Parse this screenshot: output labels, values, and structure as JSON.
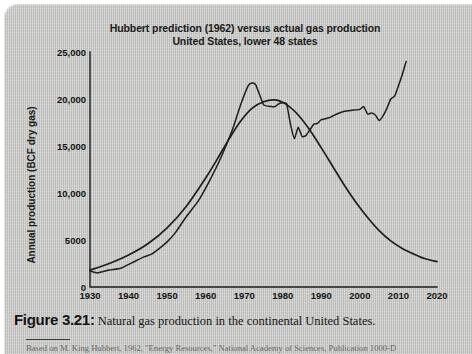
{
  "figure": {
    "number_label": "Figure 3.21:",
    "caption_text": " Natural gas production in the continental United States.",
    "attribution": "Based on M. King Hubbert, 1962, \"Energy Resources,\" National Academy of Sciences, Publication 1000-D"
  },
  "chart_data": {
    "type": "line",
    "title": "Hubbert prediction (1962) versus actual gas production United States, lower 48 states",
    "title_line1": "Hubbert prediction (1962) versus actual gas production",
    "title_line2": "United States, lower 48 states",
    "xlabel": "",
    "ylabel": "Annual production (BCF dry gas)",
    "xlim": [
      1930,
      2020
    ],
    "ylim": [
      0,
      25000
    ],
    "grid": false,
    "legend": "none",
    "xticks": [
      1930,
      1940,
      1950,
      1960,
      1970,
      1980,
      1990,
      2000,
      2010,
      2020
    ],
    "xtick_labels": [
      "1930",
      "1940",
      "1950",
      "1960",
      "1970",
      "1980",
      "1990",
      "2000",
      "2010",
      "2020"
    ],
    "yticks": [
      0,
      5000,
      10000,
      15000,
      20000,
      25000
    ],
    "ytick_labels": [
      "0",
      "5000",
      "10,000",
      "15,000",
      "20,000",
      "25,000"
    ],
    "line_color": "#1e1e1e",
    "series": [
      {
        "name": "Hubbert prediction (1962)",
        "x": [
          1930,
          1935,
          1940,
          1945,
          1950,
          1955,
          1960,
          1963,
          1966,
          1969,
          1972,
          1975,
          1978,
          1981,
          1984,
          1987,
          1990,
          1993,
          1996,
          1999,
          2002,
          2005,
          2008,
          2011,
          2014,
          2017,
          2020
        ],
        "values": [
          1800,
          2500,
          3400,
          4600,
          6300,
          8600,
          11600,
          13600,
          15700,
          17600,
          19000,
          19700,
          19900,
          19400,
          18300,
          16700,
          14800,
          12800,
          10800,
          9000,
          7400,
          6000,
          4900,
          4100,
          3500,
          3000,
          2700
        ]
      },
      {
        "name": "Actual gas production",
        "x": [
          1930,
          1932,
          1935,
          1938,
          1941,
          1944,
          1946,
          1948,
          1950,
          1952,
          1955,
          1958,
          1961,
          1964,
          1967,
          1969,
          1971,
          1972,
          1973,
          1975,
          1977,
          1978,
          1979,
          1980,
          1981,
          1982,
          1983,
          1984,
          1985,
          1986,
          1987,
          1988,
          1989,
          1990,
          1992,
          1994,
          1996,
          1998,
          2000,
          2001,
          2002,
          2003,
          2004,
          2005,
          2006,
          2007,
          2008,
          2009,
          2010,
          2011,
          2012
        ],
        "values": [
          1700,
          1500,
          1800,
          2000,
          2600,
          3200,
          3500,
          4100,
          4800,
          5700,
          7500,
          9100,
          11300,
          13800,
          16800,
          19300,
          21400,
          21700,
          21500,
          19400,
          19200,
          19200,
          19500,
          19600,
          19500,
          17300,
          15800,
          17000,
          16000,
          16100,
          16700,
          17300,
          17400,
          17800,
          18000,
          18400,
          18700,
          18800,
          18900,
          19200,
          18400,
          18500,
          18300,
          17700,
          18200,
          19000,
          20000,
          20300,
          21400,
          22600,
          24000
        ]
      }
    ]
  }
}
